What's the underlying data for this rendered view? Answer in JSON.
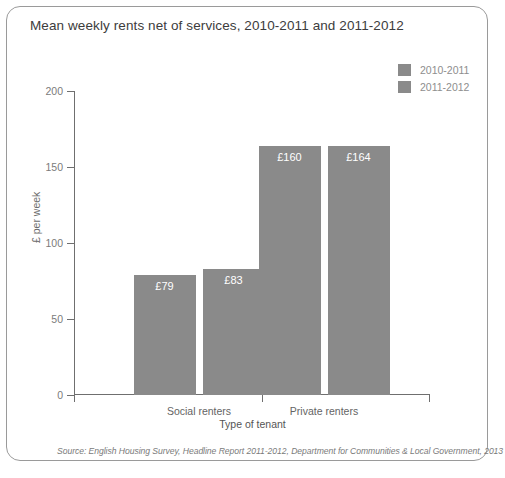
{
  "chart_data": {
    "type": "bar",
    "title": "Mean weekly rents net of services, 2010-2011 and 2011-2012",
    "xlabel": "Type of tenant",
    "ylabel": "£ per week",
    "categories": [
      "Social renters",
      "Private renters"
    ],
    "series": [
      {
        "name": "2010-2011",
        "color": "#8a8a8a",
        "values": [
          79,
          164
        ],
        "labels": [
          "£79",
          "£160"
        ]
      },
      {
        "name": "2011-2012",
        "color": "#8a8a8a",
        "values": [
          83,
          164
        ],
        "labels": [
          "£83",
          "£164"
        ]
      }
    ],
    "bars": [
      {
        "category": "Social renters",
        "series": "2010-2011",
        "value": 79,
        "label": "£79"
      },
      {
        "category": "Social renters",
        "series": "2011-2012",
        "value": 83,
        "label": "£83"
      },
      {
        "category": "Private renters",
        "series": "2010-2011",
        "value": 160,
        "label": "£160"
      },
      {
        "category": "Private renters",
        "series": "2011-2012",
        "value": 164,
        "label": "£164"
      }
    ],
    "yticks": [
      0,
      50,
      100,
      150,
      200
    ],
    "ytick_labels": [
      "0",
      "50",
      "100",
      "150",
      "200"
    ],
    "ylim": [
      0,
      200
    ],
    "grid": false,
    "legend_position": "top-right",
    "bar_color": "#8a8a8a",
    "axis_color": "#6f6f6f",
    "value_label_color": "#ffffff"
  },
  "legend": {
    "items": [
      {
        "label": "2010-2011",
        "color": "#8a8a8a"
      },
      {
        "label": "2011-2012",
        "color": "#8a8a8a"
      }
    ]
  },
  "source": {
    "text": "Source: English Housing Survey, Headline Report 2011-2012, Department for Communities & Local Government, 2013"
  }
}
